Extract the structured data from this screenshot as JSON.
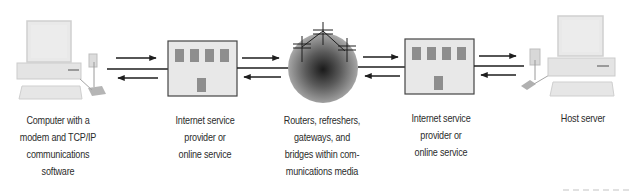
{
  "diagram": {
    "nodes": [
      {
        "id": "client-computer",
        "icon": "desktop-computer-with-modem-icon",
        "label_lines": [
          "Computer with a",
          "modem and TCP/IP",
          "communications",
          "software"
        ]
      },
      {
        "id": "isp-left",
        "icon": "building-icon",
        "label_lines": [
          "Internet service",
          "provider or",
          "online service"
        ]
      },
      {
        "id": "network-media",
        "icon": "network-sphere-icon",
        "label_lines": [
          "Routers, refreshers,",
          "gateways, and",
          "bridges within com-",
          "munications media"
        ]
      },
      {
        "id": "isp-right",
        "icon": "building-icon",
        "label_lines": [
          "Internet service",
          "provider or",
          "online service"
        ]
      },
      {
        "id": "host-server",
        "icon": "desktop-computer-with-modem-icon",
        "label_lines": [
          "Host server"
        ]
      }
    ],
    "connections": [
      {
        "from": "client-computer",
        "to": "isp-left",
        "direction": "bidirectional"
      },
      {
        "from": "isp-left",
        "to": "network-media",
        "direction": "bidirectional"
      },
      {
        "from": "network-media",
        "to": "isp-right",
        "direction": "bidirectional"
      },
      {
        "from": "isp-right",
        "to": "host-server",
        "direction": "bidirectional"
      }
    ],
    "colors": {
      "device_fill": "#e6e6e6",
      "device_stroke": "#c4c4c4",
      "building_fill": "#e8e8e8",
      "building_stroke": "#444444",
      "window_fill": "#8e8e8e",
      "line": "#1e1e1e",
      "text": "#2b2b2b"
    }
  }
}
